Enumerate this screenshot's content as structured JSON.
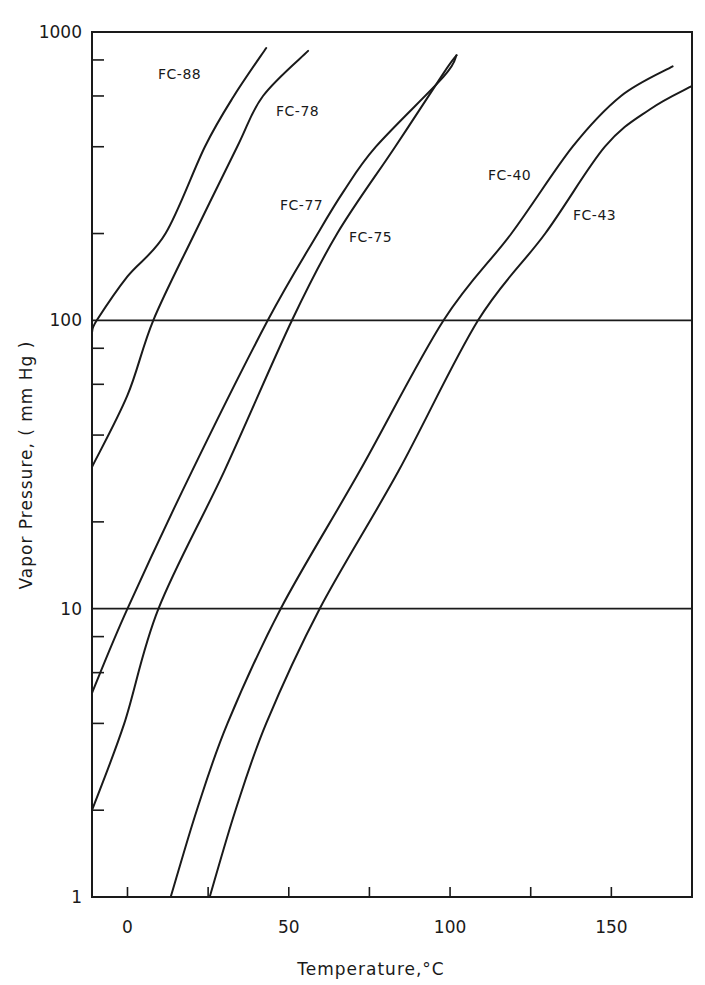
{
  "chart_data": {
    "type": "line",
    "title": "",
    "xlabel": "Temperature,°C",
    "ylabel": "Vapor  Pressure, ( mm  Hg )",
    "xscale": "linear",
    "yscale": "log",
    "xlim": [
      -11,
      175
    ],
    "ylim": [
      1,
      1000
    ],
    "x_ticks": [
      0,
      25,
      50,
      75,
      100,
      125,
      150
    ],
    "x_tick_labels": [
      "0",
      "",
      "50",
      "",
      "100",
      "",
      "150"
    ],
    "y_major_ticks": [
      1,
      10,
      100,
      1000
    ],
    "y_tick_labels": [
      "1",
      "10",
      "100",
      "1000"
    ],
    "y_minor_ticks": [
      2,
      4,
      6,
      8,
      20,
      40,
      60,
      80,
      200,
      400,
      600,
      800
    ],
    "gridlines": [
      10,
      100
    ],
    "legend": "none (inline curve labels)",
    "line_color": "#1a1a1a",
    "series": [
      {
        "name": "FC-88",
        "points": [
          [
            -11,
            91
          ],
          [
            -9.5,
            100
          ],
          [
            0,
            142
          ],
          [
            11.8,
            200
          ],
          [
            24,
            400
          ],
          [
            33,
            600
          ],
          [
            43,
            880
          ]
        ]
      },
      {
        "name": "FC-78",
        "points": [
          [
            -11,
            31
          ],
          [
            0,
            55
          ],
          [
            8,
            100
          ],
          [
            20.8,
            200
          ],
          [
            34,
            400
          ],
          [
            42,
            600
          ],
          [
            56,
            860
          ]
        ]
      },
      {
        "name": "FC-77",
        "points": [
          [
            -11,
            5.1
          ],
          [
            0,
            10
          ],
          [
            20,
            30
          ],
          [
            43.5,
            100
          ],
          [
            59,
            200
          ],
          [
            67,
            280
          ],
          [
            77,
            400
          ],
          [
            98,
            700
          ],
          [
            102,
            830
          ]
        ]
      },
      {
        "name": "FC-75",
        "points": [
          [
            -11,
            2.0
          ],
          [
            -1,
            4
          ],
          [
            9.6,
            10
          ],
          [
            30,
            30
          ],
          [
            51,
            100
          ],
          [
            65,
            200
          ],
          [
            83,
            400
          ],
          [
            98,
            720
          ],
          [
            102,
            830
          ]
        ]
      },
      {
        "name": "FC-40",
        "points": [
          [
            13.4,
            1
          ],
          [
            21.5,
            2
          ],
          [
            31,
            4
          ],
          [
            47.5,
            10
          ],
          [
            72,
            30
          ],
          [
            98,
            100
          ],
          [
            119,
            200
          ],
          [
            138,
            400
          ],
          [
            153,
            600
          ],
          [
            169,
            760
          ]
        ]
      },
      {
        "name": "FC-43",
        "points": [
          [
            25.5,
            1
          ],
          [
            33.5,
            2
          ],
          [
            43,
            4
          ],
          [
            59.6,
            10
          ],
          [
            84,
            30
          ],
          [
            108.7,
            100
          ],
          [
            129.5,
            200
          ],
          [
            148,
            400
          ],
          [
            162,
            540
          ],
          [
            175,
            650
          ]
        ]
      }
    ],
    "annotations": [
      {
        "text": "FC-88",
        "series": "FC-88"
      },
      {
        "text": "FC-78",
        "series": "FC-78"
      },
      {
        "text": "FC-77",
        "series": "FC-77"
      },
      {
        "text": "FC-75",
        "series": "FC-75"
      },
      {
        "text": "FC-40",
        "series": "FC-40"
      },
      {
        "text": "FC-43",
        "series": "FC-43"
      }
    ]
  }
}
